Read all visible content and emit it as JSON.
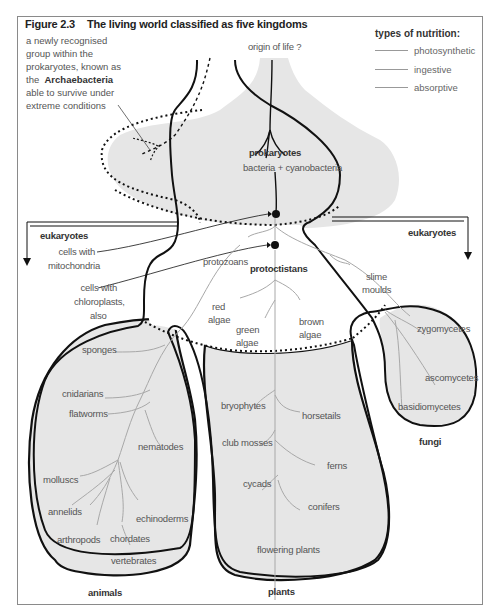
{
  "figure": {
    "number": "Figure 2.3",
    "title": "The living world classified as five kingdoms"
  },
  "legend": {
    "title": "types of nutrition:",
    "items": [
      {
        "label": "photosynthetic",
        "color": "#999999"
      },
      {
        "label": "ingestive",
        "color": "#999999"
      },
      {
        "label": "absorptive",
        "color": "#999999"
      }
    ]
  },
  "annotation": {
    "line1": "a newly recognised",
    "line2": "group within the",
    "line3": "prokaryotes, known as",
    "line4_prefix": "the",
    "line4_bold": "Archaebacteria",
    "line5": "able to survive under",
    "line6": "extreme conditions"
  },
  "nodes": {
    "origin": "origin of life ?",
    "prokaryotes": "prokaryotes",
    "prokaryotes_sub": "bacteria + cyanobacteria",
    "eukaryotes_left": "eukaryotes",
    "eukaryotes_right": "eukaryotes",
    "mitochondria_1": "cells with",
    "mitochondria_2": "mitochondria",
    "chloroplasts_1": "cells with",
    "chloroplasts_2": "chloroplasts,",
    "chloroplasts_3": "also",
    "protozoans": "protozoans",
    "protoctistans": "protoctistans",
    "slime_1": "slime",
    "slime_2": "moulds",
    "red_1": "red",
    "red_2": "algae",
    "green_1": "green",
    "green_2": "algae",
    "brown_1": "brown",
    "brown_2": "algae"
  },
  "kingdoms": {
    "animals": {
      "label": "animals",
      "members": [
        "sponges",
        "cnidarians",
        "flatworms",
        "nematodes",
        "molluscs",
        "annelids",
        "echinoderms",
        "arthropods",
        "chordates",
        "vertebrates"
      ]
    },
    "plants": {
      "label": "plants",
      "members": [
        "bryophytes",
        "horsetails",
        "club mosses",
        "ferns",
        "cycads",
        "conifers",
        "flowering plants"
      ]
    },
    "fungi": {
      "label": "fungi",
      "members": [
        "zygomycetes",
        "ascomycetes",
        "basidiomycetes"
      ]
    }
  },
  "colors": {
    "fill": "#e6e6e6",
    "outline": "#111111",
    "branch": "#a8a8a8",
    "frame": "#8a8a8a"
  }
}
